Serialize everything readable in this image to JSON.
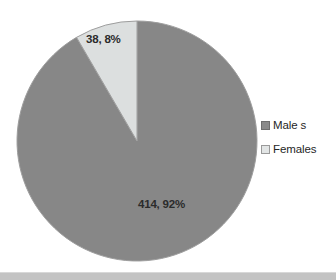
{
  "chart_data": {
    "type": "pie",
    "title": "",
    "categories": [
      "Male s",
      "Females"
    ],
    "values": [
      414,
      38
    ],
    "percents": [
      92,
      8
    ],
    "data_labels": [
      "414, 92%",
      "38, 8%"
    ],
    "legend": {
      "position": "right",
      "entries": [
        {
          "label": "Male s",
          "color": "#8a8a8a",
          "swatch": "males-swatch"
        },
        {
          "label": "Females",
          "color": "#e2e5e5",
          "swatch": "females-swatch"
        }
      ]
    },
    "colors": {
      "males_slice": "#878787",
      "females_slice": "#dcdfdf",
      "slice_outline": "#9e9e9e",
      "label_text": "#2b2b2b",
      "background": "#ffffff",
      "bottom_band": "#c3c3c3"
    },
    "geometry": {
      "center_x": 137,
      "center_y": 141,
      "radius": 120,
      "start_angle_deg": 0,
      "direction": "clockwise"
    },
    "grid": false,
    "xlabel": "",
    "ylabel": ""
  },
  "labels": {
    "females_slice_label": "38, 8%",
    "males_slice_label": "414, 92%"
  },
  "legend": {
    "males": "Male s",
    "females": "Females"
  }
}
